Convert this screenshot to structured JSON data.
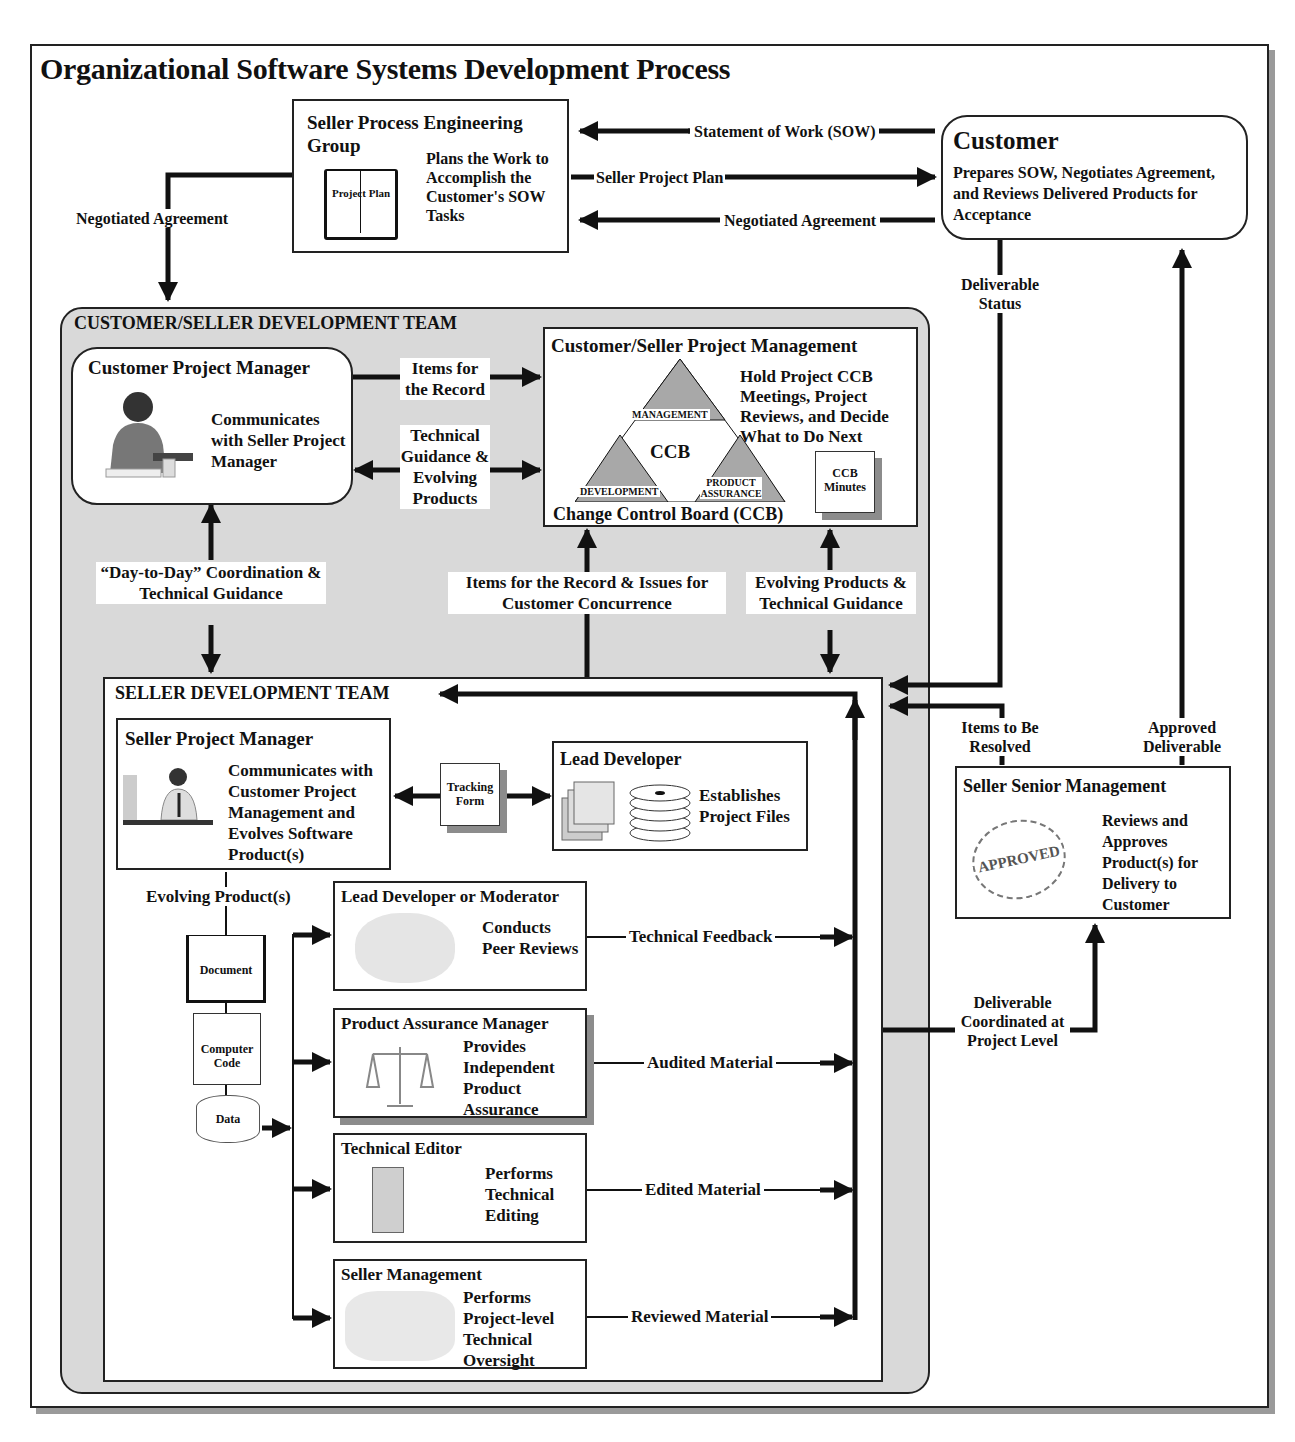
{
  "title": "Organizational Software Systems Development Process",
  "seller_process_engineering_group": {
    "heading": "Seller Process Engineering Group",
    "icon_label": "Project Plan",
    "description": "Plans the Work to Accomplish the Customer's SOW Tasks"
  },
  "customer": {
    "heading": "Customer",
    "description": "Prepares SOW, Negotiates Agreement, and Reviews Delivered Products for Acceptance"
  },
  "top_flows": {
    "sow": "Statement of Work (SOW)",
    "seller_project_plan": "Seller Project Plan",
    "negotiated_agreement_right": "Negotiated Agreement",
    "negotiated_agreement_left": "Negotiated Agreement",
    "deliverable_status": "Deliverable Status"
  },
  "customer_seller_team": {
    "heading": "CUSTOMER/SELLER DEVELOPMENT TEAM",
    "customer_pm": {
      "heading": "Customer Project Manager",
      "description": "Communicates with Seller Project Manager"
    },
    "flows": {
      "items_for_record": "Items for the Record",
      "tech_guidance": "Technical Guidance & Evolving Products",
      "day_to_day": "“Day-to-Day” Coordination & Technical Guidance",
      "items_issues": "Items for the Record & Issues for Customer Concurrence",
      "evolving_guidance": "Evolving Products & Technical Guidance"
    },
    "project_management": {
      "heading": "Customer/Seller Project Management",
      "description": "Hold Project CCB Meetings, Project Reviews, and Decide What to Do Next",
      "ccb_center": "CCB",
      "ccb_top": "MANAGEMENT",
      "ccb_left": "DEVELOPMENT",
      "ccb_right": "PRODUCT ASSURANCE",
      "ccb_caption": "Change Control Board (CCB)",
      "minutes": "CCB Minutes"
    }
  },
  "seller_team": {
    "heading": "SELLER DEVELOPMENT TEAM",
    "seller_pm": {
      "heading": "Seller Project Manager",
      "description": "Communicates with Customer Project Management and Evolves Software Product(s)"
    },
    "tracking_form": "Tracking Form",
    "lead_developer": {
      "heading": "Lead Developer",
      "description": "Establishes Project Files"
    },
    "evolving_products": "Evolving Product(s)",
    "artifacts": [
      "Document",
      "Computer Code",
      "Data"
    ],
    "reviewers": [
      {
        "heading": "Lead Developer or Moderator",
        "description": "Conducts Peer Reviews",
        "output": "Technical Feedback"
      },
      {
        "heading": "Product Assurance Manager",
        "description": "Provides Independent Product Assurance",
        "output": "Audited Material"
      },
      {
        "heading": "Technical Editor",
        "description": "Performs Technical Editing",
        "output": "Edited Material"
      },
      {
        "heading": "Seller Management",
        "description": "Performs Project-level Technical Oversight",
        "output": "Reviewed Material"
      }
    ]
  },
  "senior_management": {
    "heading": "Seller Senior Management",
    "stamp": "APPROVED",
    "description": "Reviews and Approves Product(s) for Delivery to Customer",
    "items_to_resolve": "Items to Be Resolved",
    "approved_deliverable": "Approved Deliverable",
    "deliverable_coordinated": "Deliverable Coordinated at Project Level"
  },
  "colors": {
    "line": "#111111",
    "team_fill": "#d9d9d9",
    "triangle_fill": "#a8a8a8",
    "shadow": "#8c8c8c"
  }
}
